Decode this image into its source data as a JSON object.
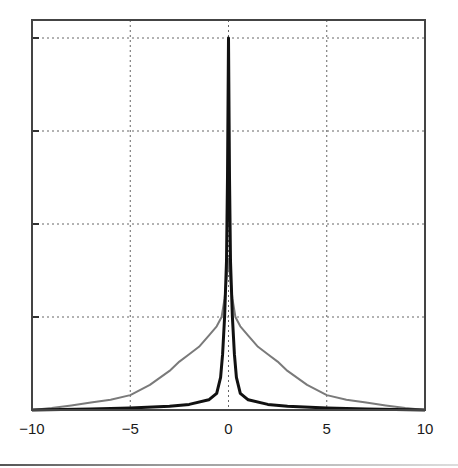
{
  "chart_data": {
    "type": "line",
    "title": "",
    "xlabel": "",
    "ylabel": "",
    "xlim": [
      -10,
      10
    ],
    "ylim": [
      0,
      4.2
    ],
    "grid": true,
    "legend": null,
    "x_ticks": [
      -10,
      -5,
      0,
      5,
      10
    ],
    "x_tick_labels": [
      "−10",
      "−5",
      "0",
      "5",
      "10"
    ],
    "y_ticks": [
      0,
      1,
      2,
      3,
      4
    ],
    "y_tick_labels": [
      "",
      "",
      "",
      "",
      ""
    ],
    "series": [
      {
        "name": "narrow-peak",
        "color": "#111111",
        "width": 3,
        "x": [
          -10,
          -7,
          -5,
          -3,
          -2,
          -1,
          -0.6,
          -0.4,
          -0.3,
          -0.2,
          -0.1,
          -0.05,
          0,
          0.05,
          0.1,
          0.2,
          0.3,
          0.4,
          0.6,
          1,
          2,
          3,
          5,
          7,
          10
        ],
        "values": [
          0,
          0.01,
          0.02,
          0.04,
          0.06,
          0.11,
          0.18,
          0.35,
          0.6,
          1.0,
          1.6,
          2.5,
          4.0,
          2.5,
          1.6,
          1.0,
          0.6,
          0.35,
          0.18,
          0.11,
          0.06,
          0.04,
          0.02,
          0.01,
          0
        ]
      },
      {
        "name": "wide-peak",
        "color": "#7a7a7a",
        "width": 2,
        "x": [
          -10,
          -9,
          -8,
          -7,
          -6,
          -5,
          -4,
          -3,
          -2.5,
          -2,
          -1.5,
          -1,
          -0.6,
          -0.35,
          -0.2,
          -0.1,
          0,
          0.1,
          0.2,
          0.35,
          0.6,
          1,
          1.5,
          2,
          2.5,
          3,
          4,
          5,
          6,
          7,
          8,
          9,
          10
        ],
        "values": [
          0,
          0.02,
          0.05,
          0.08,
          0.11,
          0.16,
          0.27,
          0.42,
          0.52,
          0.6,
          0.68,
          0.8,
          0.9,
          1.0,
          1.2,
          1.4,
          1.63,
          1.4,
          1.2,
          1.0,
          0.9,
          0.8,
          0.68,
          0.6,
          0.52,
          0.42,
          0.27,
          0.16,
          0.11,
          0.08,
          0.05,
          0.02,
          0
        ]
      }
    ]
  },
  "layout": {
    "frame": {
      "left": 32,
      "right": 425,
      "top": 20,
      "bottom": 410
    },
    "y_pixel_per_unit": 93,
    "gridline_color": "#666666",
    "frame_color": "#444444"
  }
}
